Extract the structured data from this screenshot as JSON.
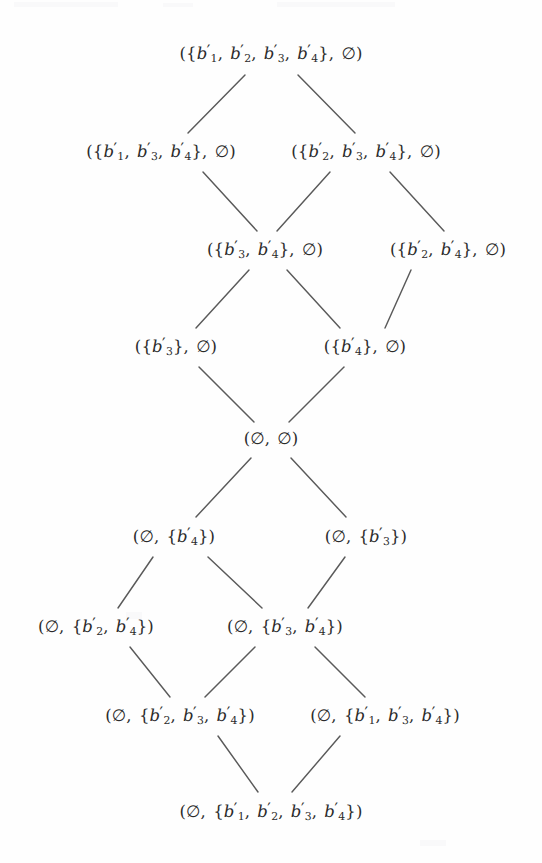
{
  "figure": {
    "type": "hasse-diagram",
    "width": 542,
    "height": 863,
    "background": "#fefefe",
    "ink_color": "#2b2b2b",
    "edge_color": "#5a5a5a"
  },
  "nodes": [
    {
      "id": "n0",
      "level": 0,
      "x": 271,
      "y": 54,
      "left_set": "{b'1, b'2, b'3, b'4}",
      "right_set": "empty",
      "label": "({b′1, b′2, b′3, b′4}, ∅)"
    },
    {
      "id": "n1",
      "level": 1,
      "x": 161,
      "y": 152,
      "left_set": "{b'1, b'3, b'4}",
      "right_set": "empty",
      "label": "({b′1, b′3, b′4}, ∅)"
    },
    {
      "id": "n2",
      "level": 1,
      "x": 366,
      "y": 152,
      "left_set": "{b'2, b'3, b'4}",
      "right_set": "empty",
      "label": "({b′2, b′3, b′4}, ∅)"
    },
    {
      "id": "n3",
      "level": 2,
      "x": 265,
      "y": 250,
      "left_set": "{b'3, b'4}",
      "right_set": "empty",
      "label": "({b′3, b′4}, ∅)"
    },
    {
      "id": "n4",
      "level": 2,
      "x": 448,
      "y": 250,
      "left_set": "{b'2, b'4}",
      "right_set": "empty",
      "label": "({b′2, b′4}, ∅)"
    },
    {
      "id": "n5",
      "level": 3,
      "x": 176,
      "y": 347,
      "left_set": "{b'3}",
      "right_set": "empty",
      "label": "({b′3}, ∅)"
    },
    {
      "id": "n6",
      "level": 3,
      "x": 365,
      "y": 347,
      "left_set": "{b'4}",
      "right_set": "empty",
      "label": "({b′4}, ∅)"
    },
    {
      "id": "n7",
      "level": 4,
      "x": 271,
      "y": 439,
      "left_set": "empty",
      "right_set": "empty",
      "label": "(∅, ∅)"
    },
    {
      "id": "n8",
      "level": 5,
      "x": 174,
      "y": 537,
      "left_set": "empty",
      "right_set": "{b'4}",
      "label": "(∅, {b′4})"
    },
    {
      "id": "n9",
      "level": 5,
      "x": 366,
      "y": 537,
      "left_set": "empty",
      "right_set": "{b'3}",
      "label": "(∅, {b′3})"
    },
    {
      "id": "n10",
      "level": 6,
      "x": 96,
      "y": 627,
      "left_set": "empty",
      "right_set": "{b'2, b'4}",
      "label": "(∅, {b′2, b′4})"
    },
    {
      "id": "n11",
      "level": 6,
      "x": 285,
      "y": 627,
      "left_set": "empty",
      "right_set": "{b'3, b'4}",
      "label": "(∅, {b′3, b′4})"
    },
    {
      "id": "n12",
      "level": 7,
      "x": 180,
      "y": 716,
      "left_set": "empty",
      "right_set": "{b'2, b'3, b'4}",
      "label": "(∅, {b′2, b′3, b′4})"
    },
    {
      "id": "n13",
      "level": 7,
      "x": 385,
      "y": 716,
      "left_set": "empty",
      "right_set": "{b'1, b'3, b'4}",
      "label": "(∅, {b′1, b′3, b′4})"
    },
    {
      "id": "n14",
      "level": 8,
      "x": 271,
      "y": 812,
      "left_set": "empty",
      "right_set": "{b'1, b'2, b'3, b'4}",
      "label": "(∅, {b′1, b′2, b′3, b′4})"
    }
  ],
  "edges": [
    {
      "from": "n0",
      "to": "n1",
      "x1": 245,
      "y1": 75,
      "x2": 188,
      "y2": 133
    },
    {
      "from": "n0",
      "to": "n2",
      "x1": 298,
      "y1": 75,
      "x2": 355,
      "y2": 133
    },
    {
      "from": "n1",
      "to": "n3",
      "x1": 203,
      "y1": 172,
      "x2": 257,
      "y2": 231
    },
    {
      "from": "n2",
      "to": "n3",
      "x1": 330,
      "y1": 172,
      "x2": 277,
      "y2": 231
    },
    {
      "from": "n2",
      "to": "n4",
      "x1": 390,
      "y1": 172,
      "x2": 444,
      "y2": 231
    },
    {
      "from": "n3",
      "to": "n5",
      "x1": 249,
      "y1": 270,
      "x2": 196,
      "y2": 328
    },
    {
      "from": "n3",
      "to": "n6",
      "x1": 287,
      "y1": 270,
      "x2": 340,
      "y2": 328
    },
    {
      "from": "n4",
      "to": "n6",
      "x1": 411,
      "y1": 270,
      "x2": 385,
      "y2": 328
    },
    {
      "from": "n5",
      "to": "n7",
      "x1": 199,
      "y1": 367,
      "x2": 254,
      "y2": 422
    },
    {
      "from": "n6",
      "to": "n7",
      "x1": 344,
      "y1": 367,
      "x2": 289,
      "y2": 422
    },
    {
      "from": "n7",
      "to": "n8",
      "x1": 251,
      "y1": 458,
      "x2": 196,
      "y2": 517
    },
    {
      "from": "n7",
      "to": "n9",
      "x1": 291,
      "y1": 458,
      "x2": 346,
      "y2": 517
    },
    {
      "from": "n8",
      "to": "n10",
      "x1": 153,
      "y1": 557,
      "x2": 118,
      "y2": 608
    },
    {
      "from": "n8",
      "to": "n11",
      "x1": 208,
      "y1": 557,
      "x2": 262,
      "y2": 608
    },
    {
      "from": "n9",
      "to": "n11",
      "x1": 345,
      "y1": 557,
      "x2": 308,
      "y2": 608
    },
    {
      "from": "n10",
      "to": "n12",
      "x1": 130,
      "y1": 647,
      "x2": 170,
      "y2": 697
    },
    {
      "from": "n11",
      "to": "n12",
      "x1": 255,
      "y1": 647,
      "x2": 205,
      "y2": 697
    },
    {
      "from": "n11",
      "to": "n13",
      "x1": 315,
      "y1": 647,
      "x2": 365,
      "y2": 697
    },
    {
      "from": "n12",
      "to": "n14",
      "x1": 218,
      "y1": 736,
      "x2": 258,
      "y2": 792
    },
    {
      "from": "n13",
      "to": "n14",
      "x1": 340,
      "y1": 736,
      "x2": 292,
      "y2": 792
    }
  ],
  "notation": {
    "empty_set_symbol": "∅",
    "variable": "b",
    "prime": "′",
    "subscripts": [
      "1",
      "2",
      "3",
      "4"
    ],
    "open_paren": "(",
    "close_paren": ")",
    "open_brace": "{",
    "close_brace": "}",
    "comma": ","
  }
}
